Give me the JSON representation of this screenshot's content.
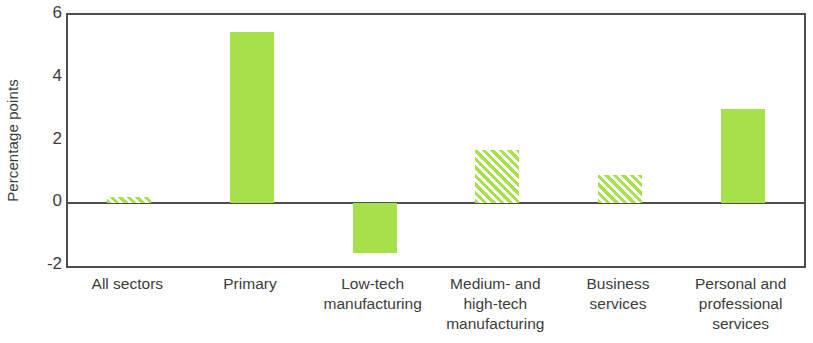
{
  "chart_data": {
    "type": "bar",
    "title": "",
    "subtitle": "",
    "xlabel": "",
    "ylabel": "Percentage points",
    "ylim": [
      -2,
      6
    ],
    "yticks": [
      6,
      4,
      2,
      0,
      -2
    ],
    "ytick_labels": [
      "6",
      "4",
      "2",
      "0",
      "-2"
    ],
    "grid": false,
    "legend": null,
    "zero_line": true,
    "bar_color": "#a6e04a",
    "axis_color": "#4d4d4d",
    "categories": [
      "All sectors",
      "Primary",
      "Low-tech manufacturing",
      "Medium- and high-tech manufacturing",
      "Business services",
      "Personal and professional services"
    ],
    "category_label_lines": [
      [
        "All sectors"
      ],
      [
        "Primary"
      ],
      [
        "Low-tech",
        "manufacturing"
      ],
      [
        "Medium- and",
        "high-tech",
        "manufacturing"
      ],
      [
        "Business",
        "services"
      ],
      [
        "Personal and",
        "professional",
        "services"
      ]
    ],
    "values": [
      0.2,
      5.45,
      -1.6,
      1.7,
      0.9,
      3.0
    ],
    "fills": [
      "hatched",
      "solid",
      "solid",
      "hatched",
      "hatched",
      "solid"
    ]
  }
}
